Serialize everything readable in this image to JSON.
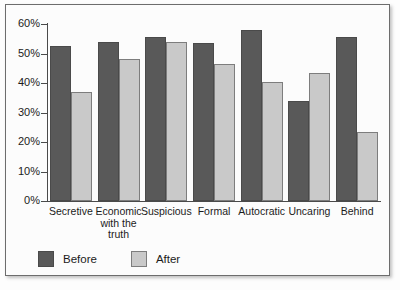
{
  "chart_data": {
    "type": "bar",
    "title": "",
    "subtitle": "",
    "xlabel": "",
    "ylabel": "",
    "ylim": [
      0,
      60
    ],
    "ytick_labels": [
      "0%",
      "10%",
      "20%",
      "30%",
      "40%",
      "50%",
      "60%"
    ],
    "ytick_values": [
      0,
      10,
      20,
      30,
      40,
      50,
      60
    ],
    "grid": false,
    "legend_position": "bottom-left",
    "categories": [
      "Secretive",
      "Economic with the truth",
      "Suspicious",
      "Formal",
      "Autocratic",
      "Uncaring",
      "Behind"
    ],
    "series": [
      {
        "name": "Before",
        "color": "#595959",
        "values": [
          52.5,
          54.0,
          55.5,
          53.5,
          58.0,
          34.0,
          55.5
        ]
      },
      {
        "name": "After",
        "color": "#c9c9c9",
        "values": [
          37.0,
          48.0,
          54.0,
          46.5,
          40.5,
          43.5,
          23.5
        ]
      }
    ]
  },
  "legend": {
    "items": [
      {
        "label": "Before",
        "swatch": "before"
      },
      {
        "label": "After",
        "swatch": "after"
      }
    ]
  }
}
